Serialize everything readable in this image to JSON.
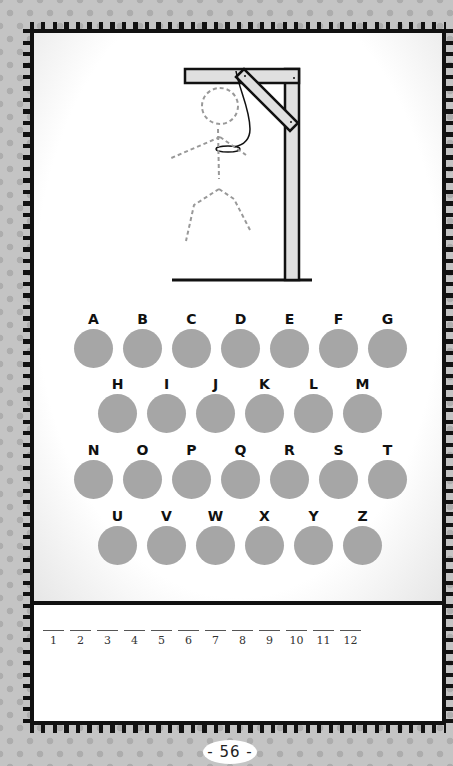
{
  "game": {
    "type": "hangman",
    "colors": {
      "background": "#c4c4c4",
      "dots": "#adadad",
      "frame": "#111111",
      "letter_circle": "#a6a6a6",
      "gallows_wood": "#e0e0e0"
    },
    "alphabet_rows": [
      [
        "A",
        "B",
        "C",
        "D",
        "E",
        "F",
        "G"
      ],
      [
        "H",
        "I",
        "J",
        "K",
        "L",
        "M"
      ],
      [
        "N",
        "O",
        "P",
        "Q",
        "R",
        "S",
        "T"
      ],
      [
        "U",
        "V",
        "W",
        "X",
        "Y",
        "Z"
      ]
    ],
    "answer_blanks": [
      "1",
      "2",
      "3",
      "4",
      "5",
      "6",
      "7",
      "8",
      "9",
      "10",
      "11",
      "12"
    ],
    "page_number": "- 56 -"
  }
}
